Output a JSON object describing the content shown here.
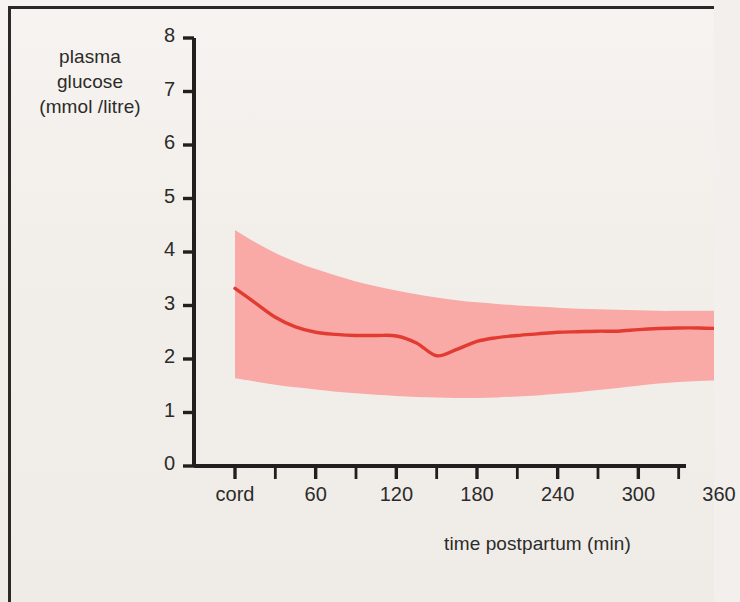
{
  "figure": {
    "background_color": "#f3f0ed",
    "border_color": "#2b2a28"
  },
  "chart_data": {
    "type": "line",
    "title": "",
    "subtitle": "",
    "xlabel": "time postpartum (min)",
    "ylabel": "plasma glucose (mmol /litre)",
    "ylabel_lines": [
      "plasma",
      "glucose",
      "(mmol /litre)"
    ],
    "grid": false,
    "legend_position": "none",
    "xlim": [
      0,
      360
    ],
    "ylim": [
      0,
      8
    ],
    "yticks": [
      0,
      1,
      2,
      3,
      4,
      5,
      6,
      7,
      8
    ],
    "ytick_labels": [
      "0",
      "1",
      "2",
      "3",
      "4",
      "5",
      "6",
      "7",
      "8"
    ],
    "xticks": [
      0,
      60,
      120,
      180,
      240,
      300,
      360
    ],
    "xtick_labels": [
      "cord",
      "60",
      "120",
      "180",
      "240",
      "300",
      "360"
    ],
    "x_minor_ticks": [
      30,
      90,
      150,
      210,
      270,
      330
    ],
    "x": [
      0,
      15,
      30,
      45,
      60,
      75,
      90,
      105,
      120,
      135,
      150,
      165,
      180,
      195,
      210,
      225,
      240,
      255,
      270,
      285,
      300,
      315,
      330,
      345,
      360
    ],
    "series": [
      {
        "name": "plasma glucose (mean)",
        "color": "#e23c32",
        "type": "line",
        "values": [
          3.32,
          3.05,
          2.78,
          2.6,
          2.5,
          2.46,
          2.44,
          2.44,
          2.43,
          2.3,
          2.06,
          2.18,
          2.33,
          2.4,
          2.44,
          2.47,
          2.5,
          2.51,
          2.52,
          2.52,
          2.55,
          2.57,
          2.58,
          2.58,
          2.57
        ]
      },
      {
        "name": "range band (upper)",
        "color": "#f9aaa6",
        "type": "band-upper",
        "values": [
          4.41,
          4.18,
          3.98,
          3.82,
          3.68,
          3.56,
          3.45,
          3.36,
          3.28,
          3.21,
          3.15,
          3.1,
          3.06,
          3.03,
          3.0,
          2.98,
          2.96,
          2.94,
          2.93,
          2.92,
          2.91,
          2.9,
          2.9,
          2.9,
          2.9
        ]
      },
      {
        "name": "range band (lower)",
        "color": "#f9aaa6",
        "type": "band-lower",
        "values": [
          1.64,
          1.58,
          1.52,
          1.47,
          1.43,
          1.39,
          1.36,
          1.33,
          1.31,
          1.29,
          1.28,
          1.27,
          1.27,
          1.28,
          1.3,
          1.32,
          1.35,
          1.38,
          1.42,
          1.46,
          1.5,
          1.54,
          1.57,
          1.59,
          1.6
        ]
      }
    ],
    "band_fill_color": "#f9aaa6",
    "line_color": "#e23c32",
    "axis_color": "#211f1e",
    "annotations": []
  }
}
